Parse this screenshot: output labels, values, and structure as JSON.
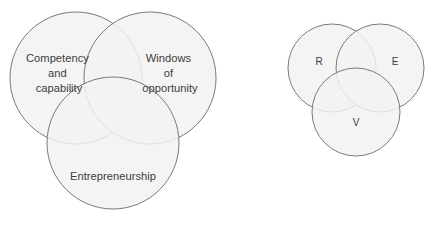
{
  "figure": {
    "background_color": "#ffffff",
    "stroke_color": "#7a7a7a",
    "fill_color": "#f2f2f2",
    "text_color": "#3d3d3d"
  },
  "diagrams": [
    {
      "id": "venn-labelled",
      "name": "entrepreneurship-venn-labelled",
      "circles": [
        {
          "name": "competency-and-capability-circle",
          "cx": 76,
          "cy": 78,
          "r": 66,
          "label_lines": [
            "Competency",
            "and",
            "capability"
          ],
          "label_x": 59,
          "label_y": 62
        },
        {
          "name": "windows-of-opportunity-circle",
          "cx": 150,
          "cy": 78,
          "r": 66,
          "label_lines": [
            "Windows",
            "of",
            "opportunity"
          ],
          "label_x": 170,
          "label_y": 62
        },
        {
          "name": "entrepreneurship-circle",
          "cx": 113,
          "cy": 143,
          "r": 66,
          "label_lines": [
            "Entrepreneurship"
          ],
          "label_x": 113,
          "label_y": 180
        }
      ]
    },
    {
      "id": "venn-initials",
      "name": "rev-venn-initials",
      "circles": [
        {
          "name": "resources-circle",
          "cx": 332,
          "cy": 68,
          "r": 44,
          "label_lines": [
            "R"
          ],
          "label_x": 319,
          "label_y": 65
        },
        {
          "name": "entrepreneur-circle",
          "cx": 380,
          "cy": 68,
          "r": 44,
          "label_lines": [
            "E"
          ],
          "label_x": 395,
          "label_y": 65
        },
        {
          "name": "venture-circle",
          "cx": 356,
          "cy": 112,
          "r": 44,
          "label_lines": [
            "V"
          ],
          "label_x": 356,
          "label_y": 126
        }
      ]
    }
  ]
}
